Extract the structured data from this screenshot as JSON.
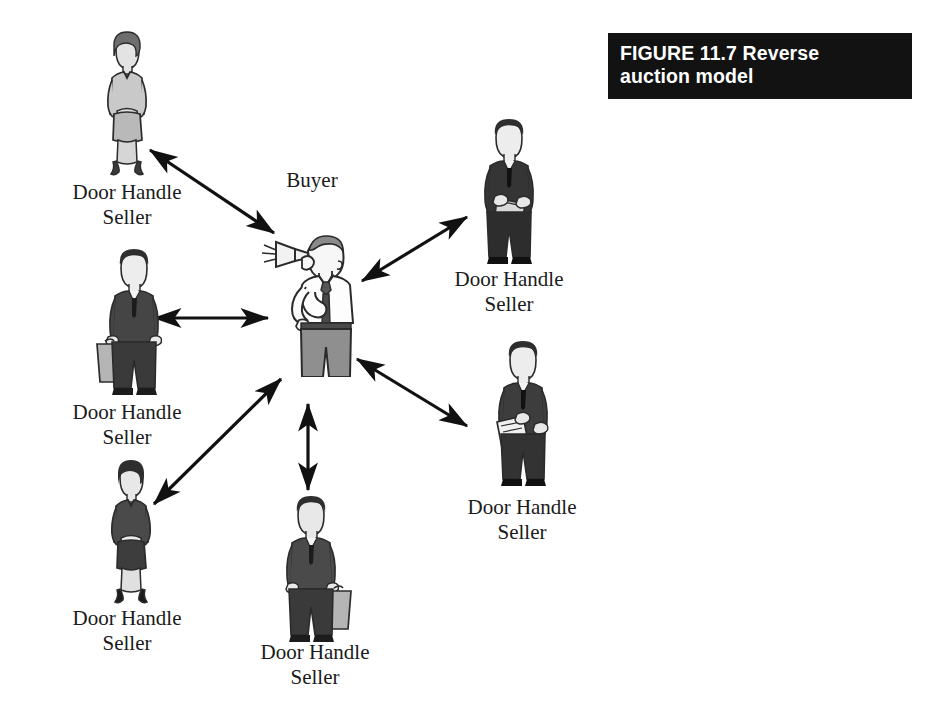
{
  "figure": {
    "caption_label": "FIGURE 11.7",
    "caption_title": "Reverse\nauction model",
    "caption_full": "FIGURE 11.7    Reverse\nauction model",
    "caption_bg_color": "#121212",
    "caption_text_color": "#ffffff"
  },
  "diagram": {
    "type": "hub-and-spoke",
    "background_color": "#ffffff",
    "line_color": "#111111",
    "center": {
      "id": "buyer",
      "label": "Buyer",
      "icon": "person-with-megaphone-icon",
      "description": "Man shouting into a megaphone"
    },
    "spokes": [
      {
        "id": "seller-top-left",
        "label": "Door Handle\nSeller",
        "line1": "Door Handle",
        "line2": "Seller",
        "icon": "businesswoman-light-suit-icon",
        "position": "top-left",
        "arrow": "bidirectional"
      },
      {
        "id": "seller-left",
        "label": "Door Handle\nSeller",
        "line1": "Door Handle",
        "line2": "Seller",
        "icon": "businessman-briefcase-icon",
        "position": "left",
        "arrow": "bidirectional"
      },
      {
        "id": "seller-bottom-left",
        "label": "Door Handle\nSeller",
        "line1": "Door Handle",
        "line2": "Seller",
        "icon": "businesswoman-dark-suit-icon",
        "position": "bottom-left",
        "arrow": "bidirectional"
      },
      {
        "id": "seller-bottom",
        "label": "Door Handle\nSeller",
        "line1": "Door Handle",
        "line2": "Seller",
        "icon": "businessman-briefcase-icon",
        "position": "bottom",
        "arrow": "bidirectional"
      },
      {
        "id": "seller-top-right",
        "label": "Door Handle\nSeller",
        "line1": "Door Handle",
        "line2": "Seller",
        "icon": "businessman-folder-icon",
        "position": "top-right",
        "arrow": "bidirectional"
      },
      {
        "id": "seller-right",
        "label": "Door Handle\nSeller",
        "line1": "Door Handle",
        "line2": "Seller",
        "icon": "businessman-clipboard-icon",
        "position": "right",
        "arrow": "bidirectional"
      }
    ]
  }
}
